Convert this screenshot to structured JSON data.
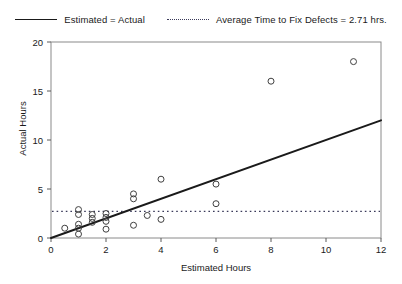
{
  "chart_data": {
    "type": "scatter",
    "title": "",
    "xlabel": "Estimated Hours",
    "ylabel": "Actual Hours",
    "xlim": [
      0,
      12
    ],
    "ylim": [
      0,
      20
    ],
    "xticks": [
      0,
      2,
      4,
      6,
      8,
      10,
      12
    ],
    "yticks": [
      0,
      5,
      10,
      15,
      20
    ],
    "grid": false,
    "legend_position": "top-center",
    "series": [
      {
        "name": "Defect observations",
        "type": "scatter",
        "marker": "open-circle",
        "color": "#404040",
        "points": [
          [
            0.5,
            1.0
          ],
          [
            1.0,
            0.4
          ],
          [
            1.0,
            1.0
          ],
          [
            1.0,
            1.4
          ],
          [
            1.0,
            2.4
          ],
          [
            1.0,
            2.9
          ],
          [
            1.5,
            1.6
          ],
          [
            1.5,
            2.0
          ],
          [
            1.5,
            2.4
          ],
          [
            2.0,
            0.9
          ],
          [
            2.0,
            1.7
          ],
          [
            2.0,
            2.1
          ],
          [
            2.0,
            2.5
          ],
          [
            3.0,
            1.3
          ],
          [
            3.0,
            4.0
          ],
          [
            3.0,
            4.5
          ],
          [
            3.5,
            2.3
          ],
          [
            4.0,
            1.9
          ],
          [
            4.0,
            6.0
          ],
          [
            6.0,
            3.5
          ],
          [
            6.0,
            5.5
          ],
          [
            8.0,
            16.0
          ],
          [
            11.0,
            18.0
          ]
        ]
      },
      {
        "name": "Estimated = Actual",
        "type": "line",
        "style": "solid",
        "color": "#1a1a1a",
        "from": [
          0,
          0
        ],
        "to": [
          12,
          12
        ]
      },
      {
        "name": "Average Time to Fix Defects = 2.71 hrs.",
        "type": "hline",
        "style": "dotted",
        "color": "#3a3a5a",
        "value": 2.71
      }
    ]
  },
  "legend": {
    "entries": [
      {
        "label": "Estimated = Actual",
        "style": "solid"
      },
      {
        "label": "Average Time to Fix Defects = 2.71 hrs.",
        "style": "dotted"
      }
    ]
  },
  "axes": {
    "x": {
      "title": "Estimated Hours",
      "tick_labels": [
        "0",
        "2",
        "4",
        "6",
        "8",
        "10",
        "12"
      ]
    },
    "y": {
      "title": "Actual Hours",
      "tick_labels": [
        "0",
        "5",
        "10",
        "15",
        "20"
      ]
    }
  }
}
